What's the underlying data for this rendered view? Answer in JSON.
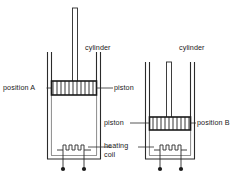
{
  "figure": {
    "type": "physics-apparatus-diagram",
    "line_color": "#2b2b2b",
    "fill_color": "#ffffff",
    "piston_hatch_color": "#8f8f8f",
    "terminal_color": "#1a1a1a"
  },
  "labels": {
    "position_a": "position A",
    "position_b": "position B",
    "piston_left": "piston",
    "piston_right": "piston",
    "cylinder_left": "cylinder",
    "cylinder_right": "cylinder",
    "heating_coil_line1": "heating",
    "heating_coil_line2": "coil"
  },
  "apparatus": {
    "left_assembly": {
      "name": "cylinder-assembly-a",
      "piston_position": "position A",
      "piston_height_label": "high",
      "rod_visible": true,
      "heating_coil": true,
      "terminals": 2
    },
    "right_assembly": {
      "name": "cylinder-assembly-b",
      "piston_position": "position B",
      "piston_height_label": "low",
      "rod_visible": true,
      "heating_coil": true,
      "terminals": 2
    }
  }
}
